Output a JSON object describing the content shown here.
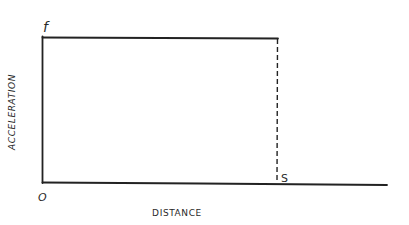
{
  "diagram": {
    "type": "acceleration-distance graph",
    "y_axis_label": "ACCELERATION",
    "x_axis_label": "DISTANCE",
    "origin_label": "O",
    "top_value_label": "f",
    "end_distance_label": "S",
    "line_color": "#222222"
  }
}
